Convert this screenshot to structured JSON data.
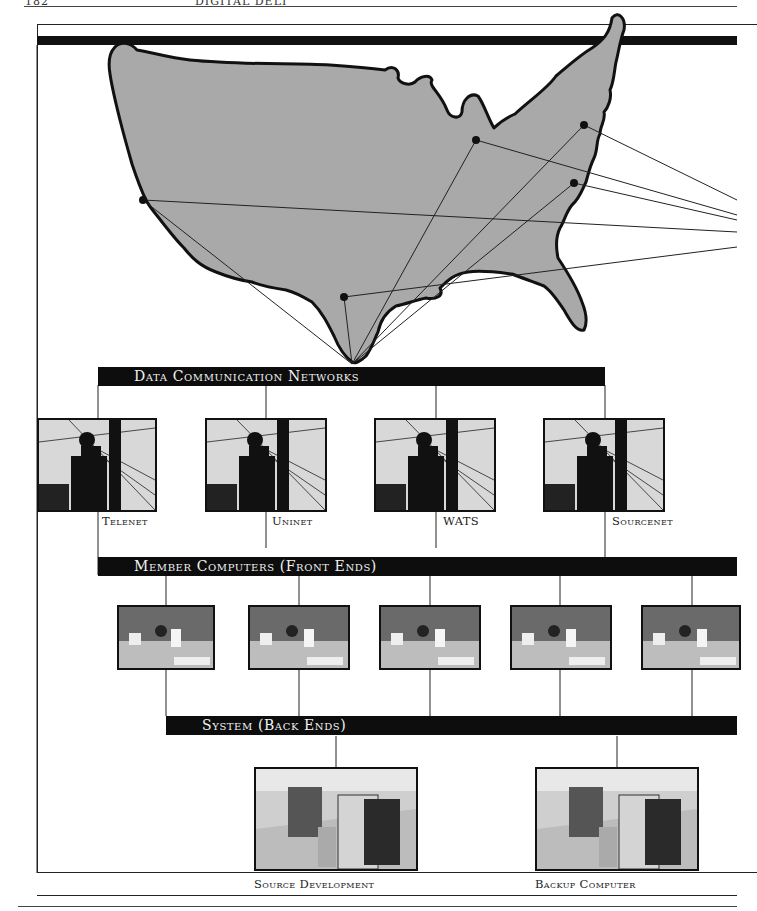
{
  "page": {
    "number": "182",
    "running_head": "DIGITAL DELI"
  },
  "map": {
    "region": "United States",
    "fill_color": "#a9a9a9",
    "outline_color": "#111111",
    "node_cities": [
      {
        "name": "west-coast-node",
        "x": 143,
        "y": 200
      },
      {
        "name": "midwest-node",
        "x": 476,
        "y": 140
      },
      {
        "name": "northeast-node",
        "x": 584,
        "y": 125
      },
      {
        "name": "east-node",
        "x": 574,
        "y": 183
      },
      {
        "name": "texas-node",
        "x": 344,
        "y": 297
      }
    ],
    "hub_point": {
      "x": 352,
      "y": 364
    }
  },
  "sections": {
    "networks": {
      "title": "Data Communication Networks",
      "items": [
        {
          "label": "Telenet",
          "photo": "lineman-on-pole"
        },
        {
          "label": "Uninet",
          "photo": "lineman-on-pole"
        },
        {
          "label": "WATS",
          "photo": "lineman-on-pole"
        },
        {
          "label": "Sourcenet",
          "photo": "lineman-on-pole"
        }
      ]
    },
    "front_ends": {
      "title": "Member Computers (Front Ends)",
      "items": [
        {
          "photo": "computer-room-operators"
        },
        {
          "photo": "computer-room-operators"
        },
        {
          "photo": "computer-room-operators"
        },
        {
          "photo": "computer-room-operators"
        },
        {
          "photo": "computer-room-operators"
        }
      ]
    },
    "back_ends": {
      "title": "System (Back Ends)",
      "items": [
        {
          "label": "Source Development",
          "photo": "mainframe-room"
        },
        {
          "label": "Backup Computer",
          "photo": "mainframe-room"
        }
      ]
    }
  },
  "colors": {
    "bar_background": "#0d0d0d",
    "bar_text": "#f2f2f2",
    "line": "#222222"
  }
}
